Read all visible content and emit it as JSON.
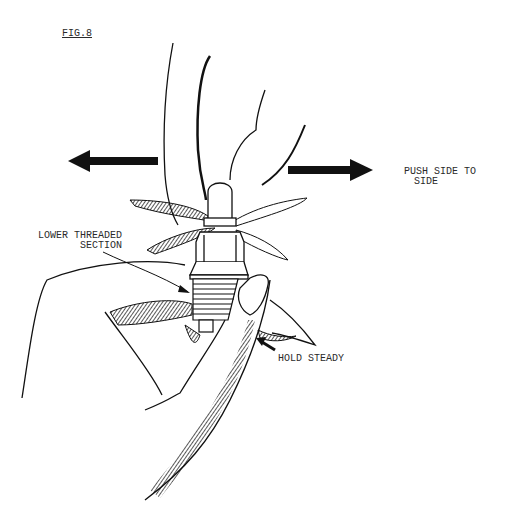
{
  "figure": {
    "title": "FIG.8",
    "labels": {
      "push_line1": "PUSH SIDE TO",
      "push_line2": "SIDE",
      "lower_line1": "LOWER THREADED",
      "lower_line2": "SECTION",
      "hold": "HOLD STEADY"
    },
    "arrows": [
      {
        "name": "left-arrow",
        "direction": "left"
      },
      {
        "name": "right-arrow",
        "direction": "right"
      },
      {
        "name": "hold-pointer-arrow",
        "direction": "up-left"
      }
    ],
    "colors": {
      "ink": "#111111",
      "background": "#ffffff"
    }
  }
}
